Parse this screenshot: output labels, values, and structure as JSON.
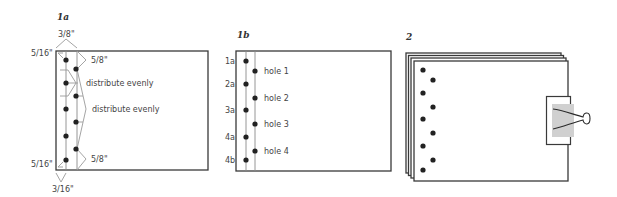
{
  "panels": {
    "fig1a": {
      "label": "1a",
      "dimensions": {
        "top_margin": "3/8\"",
        "bottom_margin": "3/16\"",
        "top_left_offset": "5/16\"",
        "bottom_left_offset": "5/16\"",
        "top_right_offset": "5/8\"",
        "bottom_right_offset": "5/8\""
      },
      "notes": [
        "distribute evenly",
        "distribute evenly"
      ]
    },
    "fig1b": {
      "label": "1b",
      "left_labels": [
        "1a",
        "2a",
        "3a",
        "4a",
        "4b"
      ],
      "hole_labels": [
        "hole 1",
        "hole 2",
        "hole 3",
        "hole 4"
      ]
    },
    "fig2": {
      "label": "2"
    }
  },
  "colors": {
    "outline": "#3a3a3a",
    "guide": "#8a8a8a",
    "dot": "#222222",
    "clip_band": "#d0d0d0"
  }
}
